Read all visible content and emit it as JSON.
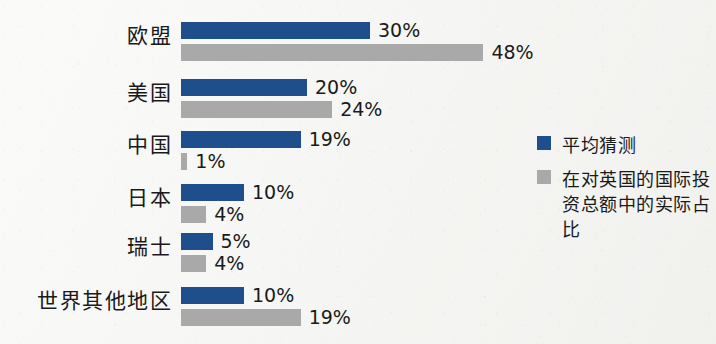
{
  "chart_data": {
    "type": "bar",
    "orientation": "horizontal",
    "title": "",
    "subtitle": "",
    "xlabel": "",
    "ylabel": "",
    "grid": false,
    "legend_position": "right",
    "unit": "%",
    "xlim": [
      0,
      48
    ],
    "categories": [
      "欧盟",
      "美国",
      "中国",
      "日本",
      "瑞士",
      "世界其他地区"
    ],
    "series": [
      {
        "name": "平均猜测",
        "color": "#1f4e8c",
        "values": [
          30,
          20,
          19,
          10,
          5,
          10
        ],
        "labels": [
          "30%",
          "20%",
          "19%",
          "10%",
          "5%",
          "10%"
        ]
      },
      {
        "name": "在对英国的国际投资总额中的实际占比",
        "color": "#a9a9a9",
        "values": [
          48,
          24,
          1,
          4,
          4,
          19
        ],
        "labels": [
          "48%",
          "24%",
          "1%",
          "4%",
          "4%",
          "19%"
        ]
      }
    ]
  },
  "legend": {
    "items": [
      {
        "label": "平均猜测",
        "color": "#1f4e8c",
        "swatch": "legend-swatch-guess"
      },
      {
        "label": "在对英国的国际投资总额中的实际占比",
        "color": "#a9a9a9",
        "swatch": "legend-swatch-actual"
      }
    ]
  },
  "colors": {
    "background": "#f5f5f3",
    "guess": "#1f4e8c",
    "actual": "#a9a9a9",
    "text": "#1a1a1a"
  }
}
